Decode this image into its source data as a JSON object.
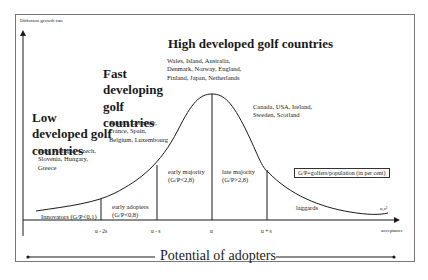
{
  "y_axis_label": "Diffusion growth rate",
  "x_axis_label": "acceptance",
  "curve_end_label": "u,s²",
  "groups": [
    {
      "title": "Low developed golf countries",
      "countries": "Italy, Portugal, Czech, Slovenia, Hungary, Greece"
    },
    {
      "title": "Fast developing golf countries",
      "countries": "Austria, Germany, France, Spain, Belgium, Luxembourg"
    },
    {
      "title": "High developed golf countries",
      "countries": "Wales, Island, Australia, Denmark, Norway, England, Finland, Japan, Netherlands"
    },
    {
      "title": "",
      "countries": "Canada, USA, Ireland, Sweden, Scotland"
    }
  ],
  "segments": [
    {
      "name": "Innovators",
      "criterion": "(G/P<0,1)"
    },
    {
      "name": "early adopters",
      "criterion": "(G/P<0,8)"
    },
    {
      "name": "early majority",
      "criterion": "(G/P<2,8)"
    },
    {
      "name": "late majority",
      "criterion": "(G/P>2,8)"
    },
    {
      "name": "laggards",
      "criterion": ""
    }
  ],
  "x_ticks": [
    "u - 2s",
    "u - s",
    "u",
    "u + s"
  ],
  "legend_note": "G/P=golfers/population (in per cent)",
  "footer": "Potential of adopters",
  "colors": {
    "line": "#1a1a1a",
    "frame": "#777777",
    "background": "#ffffff"
  }
}
